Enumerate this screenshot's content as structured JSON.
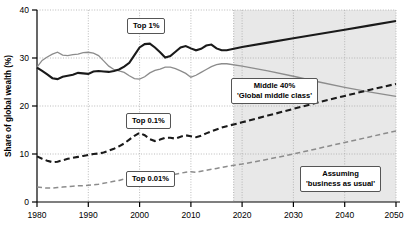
{
  "chart_data": {
    "type": "line",
    "title": "",
    "xlabel": "",
    "ylabel": "Share of global wealth (%)",
    "xlim": [
      1980,
      2050
    ],
    "ylim": [
      0,
      40
    ],
    "xticks": [
      "1980",
      "1990",
      "2000",
      "2010",
      "2020",
      "2030",
      "2040",
      "2050"
    ],
    "yticks": [
      "0",
      "10",
      "20",
      "30",
      "40"
    ],
    "grid": true,
    "legend_position": "inline-callouts",
    "projection_start": 2017,
    "projection_note": "Shaded band from 2017 to 2050 marks projected 'business as usual' values",
    "series": [
      {
        "name": "Top 1%",
        "style": "solid-thick-black",
        "color": "#1a1a1a",
        "x": [
          1980,
          1981,
          1982,
          1983,
          1984,
          1985,
          1986,
          1987,
          1988,
          1989,
          1990,
          1991,
          1992,
          1993,
          1994,
          1995,
          1996,
          1997,
          1998,
          1999,
          2000,
          2001,
          2002,
          2003,
          2004,
          2005,
          2006,
          2007,
          2008,
          2009,
          2010,
          2011,
          2012,
          2013,
          2014,
          2015,
          2016,
          2017,
          2020,
          2025,
          2030,
          2035,
          2040,
          2045,
          2050
        ],
        "values": [
          28.0,
          27.3,
          26.6,
          25.8,
          25.6,
          26.1,
          26.3,
          26.5,
          26.9,
          26.8,
          26.7,
          27.2,
          27.3,
          27.2,
          27.1,
          27.3,
          27.6,
          28.2,
          29.0,
          30.6,
          32.2,
          32.9,
          33.0,
          32.2,
          31.2,
          30.1,
          30.4,
          31.3,
          32.2,
          32.5,
          32.0,
          31.6,
          31.9,
          32.6,
          32.8,
          32.0,
          31.6,
          31.6,
          32.3,
          33.2,
          34.1,
          35.0,
          35.9,
          36.8,
          37.7
        ]
      },
      {
        "name": "Middle 40%",
        "style": "solid-thin-gray",
        "color": "#8c8c8c",
        "x": [
          1980,
          1981,
          1982,
          1983,
          1984,
          1985,
          1986,
          1987,
          1988,
          1989,
          1990,
          1991,
          1992,
          1993,
          1994,
          1995,
          1996,
          1997,
          1998,
          1999,
          2000,
          2001,
          2002,
          2003,
          2004,
          2005,
          2006,
          2007,
          2008,
          2009,
          2010,
          2011,
          2012,
          2013,
          2014,
          2015,
          2016,
          2017,
          2020,
          2025,
          2030,
          2035,
          2040,
          2045,
          2050
        ],
        "values": [
          28.1,
          29.5,
          30.2,
          30.8,
          31.2,
          30.6,
          30.5,
          30.7,
          30.8,
          31.1,
          31.2,
          31.0,
          30.5,
          29.4,
          28.3,
          27.6,
          27.3,
          27.0,
          26.3,
          25.7,
          25.6,
          26.1,
          26.9,
          27.4,
          27.7,
          28.1,
          28.1,
          27.8,
          27.3,
          26.8,
          26.0,
          26.4,
          27.0,
          27.6,
          28.2,
          28.6,
          28.8,
          28.8,
          28.3,
          27.3,
          26.2,
          25.0,
          23.9,
          22.9,
          22.0
        ]
      },
      {
        "name": "Top 0.1%",
        "style": "dashed-thick-black",
        "color": "#1a1a1a",
        "x": [
          1980,
          1981,
          1982,
          1983,
          1984,
          1985,
          1986,
          1987,
          1988,
          1989,
          1990,
          1991,
          1992,
          1993,
          1994,
          1995,
          1996,
          1997,
          1998,
          1999,
          2000,
          2001,
          2002,
          2003,
          2004,
          2005,
          2006,
          2007,
          2008,
          2009,
          2010,
          2011,
          2012,
          2013,
          2014,
          2015,
          2016,
          2017,
          2020,
          2025,
          2030,
          2035,
          2040,
          2045,
          2050
        ],
        "values": [
          9.5,
          9.0,
          8.6,
          8.3,
          8.4,
          8.7,
          9.0,
          9.2,
          9.4,
          9.6,
          9.8,
          10.0,
          10.1,
          10.3,
          10.7,
          11.1,
          11.6,
          12.2,
          13.0,
          13.8,
          14.4,
          13.9,
          13.1,
          12.7,
          13.0,
          13.4,
          13.4,
          13.2,
          13.6,
          13.9,
          13.7,
          13.5,
          13.8,
          14.3,
          14.7,
          15.1,
          15.5,
          15.8,
          16.6,
          18.0,
          19.4,
          20.8,
          22.1,
          23.4,
          24.6
        ]
      },
      {
        "name": "Top 0.01%",
        "style": "dashed-thin-gray",
        "color": "#8c8c8c",
        "x": [
          1980,
          1981,
          1982,
          1983,
          1984,
          1985,
          1986,
          1987,
          1988,
          1989,
          1990,
          1991,
          1992,
          1993,
          1994,
          1995,
          1996,
          1997,
          1998,
          1999,
          2000,
          2001,
          2002,
          2003,
          2004,
          2005,
          2006,
          2007,
          2008,
          2009,
          2010,
          2011,
          2012,
          2013,
          2014,
          2015,
          2016,
          2017,
          2020,
          2025,
          2030,
          2035,
          2040,
          2045,
          2050
        ],
        "values": [
          3.1,
          3.0,
          2.9,
          2.9,
          3.0,
          3.1,
          3.2,
          3.3,
          3.4,
          3.4,
          3.5,
          3.6,
          3.7,
          3.9,
          4.1,
          4.3,
          4.5,
          4.8,
          5.1,
          5.5,
          5.9,
          5.7,
          5.4,
          5.3,
          5.5,
          5.7,
          5.8,
          5.8,
          6.0,
          6.2,
          6.3,
          6.2,
          6.4,
          6.6,
          6.8,
          7.0,
          7.2,
          7.4,
          7.9,
          8.9,
          10.0,
          11.2,
          12.4,
          13.6,
          14.8
        ]
      }
    ],
    "annotations": [
      {
        "id": "top1",
        "label_line1": "Top 1%",
        "label_line2": ""
      },
      {
        "id": "middle40",
        "label_line1": "Middle 40%",
        "label_line2": "'Global middle class'"
      },
      {
        "id": "top01",
        "label_line1": "Top 0.1%",
        "label_line2": ""
      },
      {
        "id": "top001",
        "label_line1": "Top 0.01%",
        "label_line2": ""
      },
      {
        "id": "assumption",
        "label_line1": "Assuming",
        "label_line2": "'business as usual'"
      }
    ],
    "colors": {
      "top1": "#1a1a1a",
      "middle40": "#8c8c8c",
      "top01": "#1a1a1a",
      "top001": "#8c8c8c",
      "projection_band": "#e8e8e8",
      "grid": "#b4b4b4",
      "axis": "#000000"
    }
  }
}
